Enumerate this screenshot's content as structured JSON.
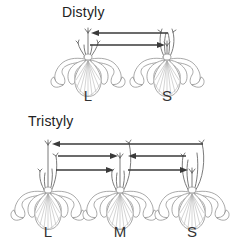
{
  "figure": {
    "background_color": "#ffffff",
    "width": 238,
    "height": 243,
    "line_color": "#8c8c8c",
    "arrow_color": "#3a3a3a",
    "text_color": "#333333"
  },
  "panels": [
    {
      "id": "distyly",
      "title": "Distyly",
      "title_x": 62,
      "title_y": 17,
      "flowers": [
        {
          "morph": "L",
          "label": "L",
          "label_x": 88,
          "label_y": 100,
          "center_x": 88,
          "base_y": 62,
          "style_length": "long",
          "stamen_length": "short",
          "style_tip_y": 31,
          "stamen_tip_y": 43
        },
        {
          "morph": "S",
          "label": "S",
          "label_x": 167,
          "label_y": 100,
          "center_x": 167,
          "base_y": 62,
          "style_length": "short",
          "stamen_length": "long",
          "style_tip_y": 44,
          "stamen_tip_y": 31
        }
      ],
      "arrows": [
        {
          "id": "S-stamen-to-L-stigma",
          "from": "S",
          "to": "L",
          "direction": "left",
          "y": 33,
          "x_start": 168,
          "x_end": 92,
          "level": "high"
        },
        {
          "id": "L-stamen-to-S-stigma",
          "from": "L",
          "to": "S",
          "direction": "right",
          "y": 45,
          "x_start": 90,
          "x_end": 166,
          "level": "low"
        }
      ]
    },
    {
      "id": "tristyly",
      "title": "Tristyly",
      "title_x": 28,
      "title_y": 126,
      "flowers": [
        {
          "morph": "L",
          "label": "L",
          "label_x": 48,
          "label_y": 236,
          "center_x": 48,
          "base_y": 195,
          "style_length": "long",
          "stamen_length": "mid-short",
          "style_tip_y": 143,
          "stamen_tip_y": 155
        },
        {
          "morph": "M",
          "label": "M",
          "label_x": 120,
          "label_y": 236,
          "center_x": 120,
          "base_y": 195,
          "style_length": "mid",
          "stamen_length": "long-short",
          "style_tip_y": 155,
          "stamen_tip_y": 142
        },
        {
          "morph": "S",
          "label": "S",
          "label_x": 192,
          "label_y": 236,
          "center_x": 192,
          "base_y": 195,
          "style_length": "short",
          "stamen_length": "long-mid",
          "style_tip_y": 170,
          "stamen_tip_y": 142
        }
      ],
      "arrows": [
        {
          "id": "S-long-stamen-to-L-stigma",
          "from": "S",
          "to": "L",
          "direction": "left",
          "y": 144,
          "x_start": 196,
          "x_end": 52,
          "level": "high"
        },
        {
          "id": "L-stamen-to-M-stigma",
          "from": "L",
          "to": "M",
          "direction": "right",
          "y": 156,
          "x_start": 54,
          "x_end": 118,
          "level": "mid"
        },
        {
          "id": "S-mid-stamen-to-M-stigma",
          "from": "S",
          "to": "M",
          "direction": "left",
          "y": 156,
          "x_start": 190,
          "x_end": 128,
          "level": "mid"
        },
        {
          "id": "L-lower-stamen-to-S-stigma",
          "from": "L",
          "to": "S",
          "direction": "right",
          "y": 170,
          "x_start": 54,
          "x_end": 114,
          "level": "low"
        },
        {
          "id": "M-stamen-to-S-stigma",
          "from": "M",
          "to": "S",
          "direction": "right",
          "y": 170,
          "x_start": 126,
          "x_end": 188,
          "level": "low"
        }
      ]
    }
  ]
}
